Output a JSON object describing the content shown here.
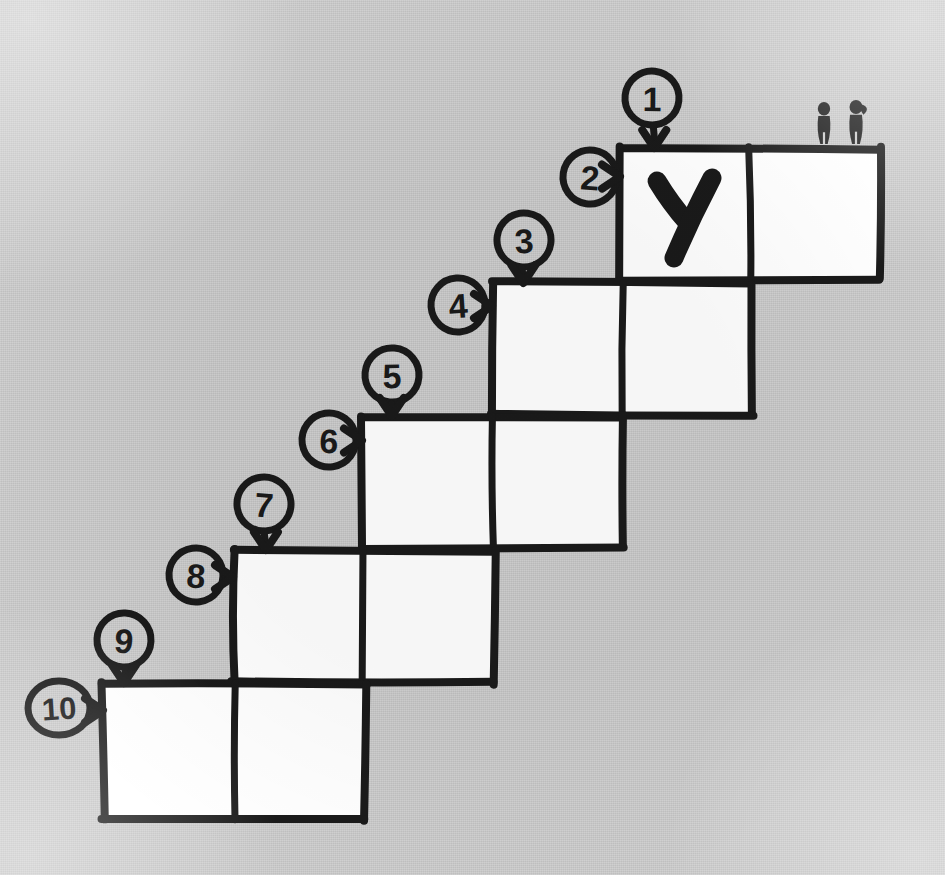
{
  "canvas": {
    "width": 945,
    "height": 875,
    "background_color": "#cdcdcd",
    "ink_color": "#1a1a1a",
    "cell_fill_color": "#ffffff",
    "style": "hand-drawn marker sketch on gray paper"
  },
  "diagram": {
    "type": "hand-drawn staircase diagram",
    "step_count": 5,
    "cells_per_step": 2,
    "callout_count": 10
  },
  "steps": [
    {
      "index": 1,
      "x": 620,
      "y": 148,
      "width": 260,
      "height": 132,
      "cells": [
        {
          "index": 1,
          "content": "y",
          "has_content": true
        },
        {
          "index": 2,
          "content": "",
          "has_content": false
        }
      ]
    },
    {
      "index": 2,
      "x": 492,
      "y": 283,
      "width": 260,
      "height": 132,
      "cells": [
        {
          "index": 1,
          "content": "",
          "has_content": false
        },
        {
          "index": 2,
          "content": "",
          "has_content": false
        }
      ]
    },
    {
      "index": 3,
      "x": 362,
      "y": 416,
      "width": 261,
      "height": 132,
      "cells": [
        {
          "index": 1,
          "content": "",
          "has_content": false
        },
        {
          "index": 2,
          "content": "",
          "has_content": false
        }
      ]
    },
    {
      "index": 4,
      "x": 233,
      "y": 550,
      "width": 261,
      "height": 133,
      "cells": [
        {
          "index": 1,
          "content": "",
          "has_content": false
        },
        {
          "index": 2,
          "content": "",
          "has_content": false
        }
      ]
    },
    {
      "index": 5,
      "x": 103,
      "y": 683,
      "width": 262,
      "height": 137,
      "cells": [
        {
          "index": 1,
          "content": "",
          "has_content": false
        },
        {
          "index": 2,
          "content": "",
          "has_content": false
        }
      ]
    }
  ],
  "callouts": [
    {
      "label": "1",
      "cx": 652,
      "cy": 98,
      "arrow": "down",
      "target_step": 1,
      "target_edge": "top"
    },
    {
      "label": "2",
      "cx": 590,
      "cy": 177,
      "arrow": "right",
      "target_step": 1,
      "target_edge": "left"
    },
    {
      "label": "3",
      "cx": 524,
      "cy": 240,
      "arrow": "down",
      "target_step": 2,
      "target_edge": "top"
    },
    {
      "label": "4",
      "cx": 458,
      "cy": 305,
      "arrow": "right",
      "target_step": 2,
      "target_edge": "left"
    },
    {
      "label": "5",
      "cx": 392,
      "cy": 375,
      "arrow": "down",
      "target_step": 3,
      "target_edge": "top"
    },
    {
      "label": "6",
      "cx": 329,
      "cy": 440,
      "arrow": "right",
      "target_step": 3,
      "target_edge": "left"
    },
    {
      "label": "7",
      "cx": 264,
      "cy": 504,
      "arrow": "down",
      "target_step": 4,
      "target_edge": "top"
    },
    {
      "label": "8",
      "cx": 196,
      "cy": 575,
      "arrow": "right",
      "target_step": 4,
      "target_edge": "left"
    },
    {
      "label": "9",
      "cx": 124,
      "cy": 640,
      "arrow": "down",
      "target_step": 5,
      "target_edge": "top"
    },
    {
      "label": "10",
      "cx": 59,
      "cy": 708,
      "arrow": "right",
      "target_step": 5,
      "target_edge": "left"
    }
  ],
  "figures": [
    {
      "name": "person-left",
      "x": 824,
      "y": 102,
      "height": 42,
      "description": "small standing human silhouette"
    },
    {
      "name": "person-right",
      "x": 856,
      "y": 100,
      "height": 44,
      "description": "small standing human silhouette with ponytail"
    }
  ],
  "annotations": {
    "letter_in_first_cell": "y"
  }
}
